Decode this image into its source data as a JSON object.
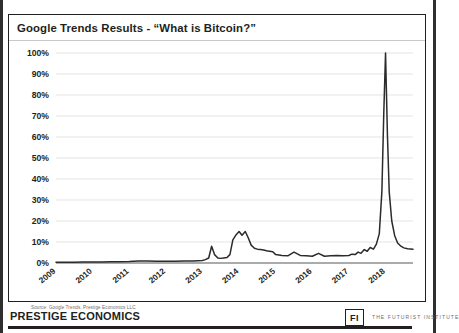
{
  "slide": {
    "title": "Google Trends Results - “What is Bitcoin?”",
    "source_note": "Source: Google Trends, Prestige Economics LLC"
  },
  "footer": {
    "brand": "PRESTIGE ECONOMICS",
    "fi_mark": "FI",
    "institute": "THE FUTURIST INSTITUTE"
  },
  "colors": {
    "line": "#2b2b2b",
    "grid": "#d9d9d9",
    "axis": "#595959",
    "text": "#231f20",
    "frame": "#231f20"
  },
  "chart_data": {
    "type": "line",
    "title": "Google Trends Results - “What is Bitcoin?”",
    "xlabel": "",
    "ylabel": "",
    "ylim": [
      0,
      100
    ],
    "yticks": [
      0,
      10,
      20,
      30,
      40,
      50,
      60,
      70,
      80,
      90,
      100
    ],
    "ytick_labels": [
      "0%",
      "10%",
      "20%",
      "30%",
      "40%",
      "50%",
      "60%",
      "70%",
      "80%",
      "90%",
      "100%"
    ],
    "xlim": [
      2009,
      2018.75
    ],
    "xticks": [
      2009,
      2010,
      2011,
      2012,
      2013,
      2014,
      2015,
      2016,
      2017,
      2018
    ],
    "xtick_labels": [
      "2009",
      "2010",
      "2011",
      "2012",
      "2013",
      "2014",
      "2015",
      "2016",
      "2017",
      "2018"
    ],
    "grid": true,
    "legend": false,
    "series": [
      {
        "name": "What is Bitcoin? (search interest)",
        "x": [
          2009.0,
          2009.25,
          2009.5,
          2009.75,
          2010.0,
          2010.25,
          2010.5,
          2010.75,
          2011.0,
          2011.25,
          2011.5,
          2011.75,
          2012.0,
          2012.25,
          2012.5,
          2012.75,
          2013.0,
          2013.08,
          2013.17,
          2013.25,
          2013.33,
          2013.42,
          2013.5,
          2013.58,
          2013.67,
          2013.75,
          2013.83,
          2013.92,
          2014.0,
          2014.08,
          2014.17,
          2014.25,
          2014.33,
          2014.42,
          2014.5,
          2014.58,
          2014.67,
          2014.75,
          2014.83,
          2014.92,
          2015.0,
          2015.17,
          2015.33,
          2015.5,
          2015.67,
          2015.83,
          2016.0,
          2016.17,
          2016.33,
          2016.5,
          2016.67,
          2016.83,
          2017.0,
          2017.08,
          2017.17,
          2017.25,
          2017.33,
          2017.42,
          2017.5,
          2017.58,
          2017.67,
          2017.75,
          2017.83,
          2017.9,
          2017.95,
          2018.0,
          2018.05,
          2018.1,
          2018.17,
          2018.25,
          2018.33,
          2018.42,
          2018.5,
          2018.6,
          2018.75
        ],
        "values": [
          0.4,
          0.4,
          0.4,
          0.5,
          0.5,
          0.5,
          0.6,
          0.6,
          0.7,
          0.9,
          1.0,
          0.8,
          0.8,
          0.8,
          0.9,
          1.0,
          1.2,
          1.6,
          2.4,
          8.0,
          4.0,
          2.4,
          2.2,
          2.4,
          2.6,
          4.0,
          11.0,
          13.5,
          15.0,
          13.2,
          15.0,
          12.0,
          8.5,
          7.0,
          6.6,
          6.4,
          6.2,
          5.8,
          5.6,
          5.4,
          4.0,
          3.6,
          3.4,
          5.2,
          3.6,
          3.4,
          3.2,
          4.6,
          3.2,
          3.4,
          3.6,
          3.4,
          3.6,
          4.2,
          4.0,
          5.2,
          4.6,
          6.4,
          5.6,
          7.4,
          6.6,
          9.0,
          14.0,
          34.0,
          70.0,
          100.0,
          62.0,
          34.0,
          20.0,
          13.0,
          9.5,
          8.0,
          7.2,
          6.8,
          6.6
        ]
      }
    ],
    "annotations": [
      {
        "label": "peak",
        "x": 2018.0,
        "y": 100,
        "note": "Dec 2017 / Jan 2018 peak at 100%"
      },
      {
        "label": "early-flat",
        "x": 2011.0,
        "y": 0.7,
        "note": "near zero 2009-2012"
      },
      {
        "label": "2013-spike",
        "x": 2013.25,
        "y": 8.0,
        "note": "April 2013 mini-spike"
      },
      {
        "label": "2014-plateau",
        "x": 2014.0,
        "y": 15.0,
        "note": "late 2013 - early 2014 plateau"
      }
    ]
  }
}
